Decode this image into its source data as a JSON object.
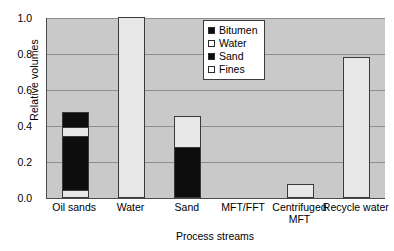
{
  "chart_data": {
    "type": "bar",
    "subtype": "stacked-bar",
    "title": "",
    "xlabel": "Process streams",
    "ylabel": "Relative volumes",
    "categories": [
      "Oil sands",
      "Water",
      "Sand",
      "MFT/FFT",
      "Centrifuged MFT",
      "Recycle water"
    ],
    "ylim": [
      0.0,
      1.0
    ],
    "yticks": [
      "1.0",
      "0.8",
      "0.6",
      "0.4",
      "0.2",
      "0.0"
    ],
    "ytick_values": [
      1.0,
      0.8,
      0.6,
      0.4,
      0.2,
      0.0
    ],
    "grid": true,
    "legend_position": "upper center",
    "series": [
      {
        "name": "Bitumen",
        "color": "#0d0d0d",
        "fill": "dark",
        "values": [
          0.08,
          0.0,
          0.0,
          0.0,
          0.0,
          0.0
        ]
      },
      {
        "name": "Water",
        "color": "#e8e8e8",
        "fill": "light",
        "values": [
          0.05,
          1.0,
          0.17,
          0.0,
          0.07,
          0.78
        ]
      },
      {
        "name": "Sand",
        "color": "#0d0d0d",
        "fill": "dark",
        "values": [
          0.3,
          0.0,
          0.28,
          0.0,
          0.0,
          0.0
        ]
      },
      {
        "name": "Fines",
        "color": "#e8e8e8",
        "fill": "light",
        "values": [
          0.04,
          0.0,
          0.0,
          0.0,
          0.0,
          0.0
        ]
      }
    ],
    "bar_totals": [
      0.47,
      1.0,
      0.45,
      0.0,
      0.07,
      0.78
    ],
    "stack_order_bottom_to_top": [
      "Fines",
      "Sand",
      "Water",
      "Bitumen"
    ]
  },
  "legend": {
    "entries": [
      {
        "label": "Bitumen",
        "fill": "dark"
      },
      {
        "label": "Water",
        "fill": "light"
      },
      {
        "label": "Sand",
        "fill": "dark"
      },
      {
        "label": "Fines",
        "fill": "light"
      }
    ]
  },
  "colors": {
    "plot_background": "#c9c9c9",
    "gridline": "#8e8e8e",
    "axis": "#4d4d4d",
    "dark_fill": "#0d0d0d",
    "light_fill": "#e8e8e8",
    "page_background": "#ffffff"
  }
}
